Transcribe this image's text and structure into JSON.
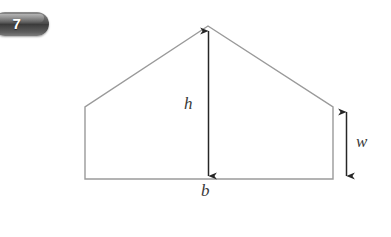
{
  "badge": {
    "number": "7",
    "color": "#4a4a4a",
    "text_color": "#ffffff"
  },
  "figure": {
    "name": "pentagon-house-shape",
    "stroke_color": "#9a9a9a",
    "arrow_color": "#262626",
    "vertices": {
      "bottom_left": [
        85,
        179
      ],
      "top_left": [
        85,
        107
      ],
      "apex": [
        208,
        26
      ],
      "top_right": [
        333,
        107
      ],
      "bottom_right": [
        333,
        179
      ]
    },
    "labels": {
      "height": "h",
      "width": "w",
      "base": "b"
    },
    "dimension_arrows": [
      {
        "name": "height-arrow",
        "from": [
          208,
          29
        ],
        "to": [
          208,
          178
        ],
        "label": "h"
      },
      {
        "name": "width-arrow",
        "from": [
          346,
          110
        ],
        "to": [
          346,
          178
        ],
        "label": "w"
      },
      {
        "name": "base-edge",
        "from": [
          85,
          179
        ],
        "to": [
          333,
          179
        ],
        "label": "b"
      }
    ]
  }
}
